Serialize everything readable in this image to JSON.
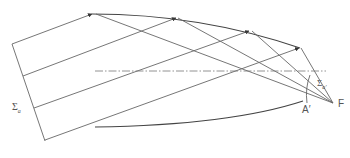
{
  "diagram": {
    "type": "reflector-ray-diagram",
    "labels": {
      "incident_wavefront": "Σ",
      "incident_wavefront_sub": "a",
      "reflected_wavefront": "Σ",
      "reflected_wavefront_sub": "a'",
      "point_a_prime": "A′",
      "focus": "F"
    },
    "colors": {
      "line": "#555555",
      "reflector": "#444444",
      "axis": "#666666",
      "text": "#555555"
    },
    "rays": [
      {
        "start": [
          12,
          44
        ],
        "hit": [
          92,
          14
        ]
      },
      {
        "start": [
          23,
          76
        ],
        "hit": [
          176,
          18
        ]
      },
      {
        "start": [
          34,
          108
        ],
        "hit": [
          250,
          31
        ]
      },
      {
        "start": [
          45,
          140
        ],
        "hit": [
          300,
          48
        ]
      }
    ],
    "focus_point": [
      333,
      103
    ],
    "axis": {
      "from": [
        95,
        71
      ],
      "to": [
        325,
        71
      ],
      "style": "dash-dot"
    }
  }
}
